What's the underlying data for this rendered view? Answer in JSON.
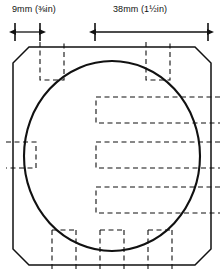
{
  "figure": {
    "type": "engineering-drawing",
    "title": "",
    "background_color": "#ffffff",
    "line_color": "#111111",
    "dimensions": [
      {
        "name": "small-dimension",
        "label_mm": "9mm",
        "label_in": "(⅜in)",
        "label": "9mm (⅜in)",
        "value_mm": 9,
        "value_in": 0.375,
        "start_x": 15,
        "end_x": 40,
        "line_y": 32
      },
      {
        "name": "large-dimension",
        "label_mm": "38mm",
        "label_in": "(1½in)",
        "label": "38mm (1½in)",
        "value_mm": 38,
        "value_in": 1.5,
        "start_x": 95,
        "end_x": 208,
        "line_y": 32
      }
    ],
    "outline": {
      "name": "chamfered-square-outline",
      "left": 13,
      "top": 47,
      "right": 211,
      "bottom": 265,
      "chamfer": 16,
      "stroke_width": 1.4
    },
    "circle": {
      "name": "bore-circle",
      "center_x": 112,
      "center_y": 156,
      "radius_x": 88,
      "radius_y": 95,
      "stroke_width": 2
    },
    "hidden_features": [
      {
        "name": "hidden-square-top-left",
        "x": 40,
        "y": 42,
        "w": 24,
        "h": 38
      },
      {
        "name": "hidden-square-top-right",
        "x": 146,
        "y": 42,
        "w": 24,
        "h": 38
      },
      {
        "name": "hidden-square-left-middle",
        "x": 6,
        "y": 142,
        "w": 30,
        "h": 26
      },
      {
        "name": "hidden-slot-upper-right",
        "x": 96,
        "y": 97,
        "w": 124,
        "h": 26
      },
      {
        "name": "hidden-slot-middle-right",
        "x": 96,
        "y": 142,
        "w": 124,
        "h": 26
      },
      {
        "name": "hidden-slot-lower-right",
        "x": 96,
        "y": 187,
        "w": 124,
        "h": 26
      },
      {
        "name": "hidden-square-bottom-left",
        "x": 52,
        "y": 230,
        "w": 24,
        "h": 40
      },
      {
        "name": "hidden-square-bottom-center",
        "x": 100,
        "y": 230,
        "w": 24,
        "h": 40
      },
      {
        "name": "hidden-square-bottom-right",
        "x": 148,
        "y": 230,
        "w": 24,
        "h": 40
      }
    ]
  }
}
